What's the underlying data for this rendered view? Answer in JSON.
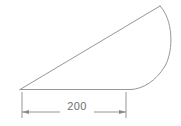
{
  "drawing": {
    "title": "Circular segment with base dimension",
    "background_color": "#ffffff",
    "line_color": "#8a8a8a",
    "text_color": "#6e6e6e",
    "line_width": 0.9,
    "shape": {
      "name": "circular-segment",
      "vertices": {
        "left_base": [
          20,
          89.5
        ],
        "apex": [
          160,
          6
        ],
        "arc_base_end": [
          131,
          89.5
        ]
      },
      "chord_path": "M 20 89.5 L 160 6",
      "arc_path": "M 160 6 C 173 19 174 50 165 66 C 156 81 143 89 131 89.5",
      "base_path": "M 131 89.5 L 20 89.5"
    },
    "dimension": {
      "label": "200",
      "label_position": [
        77,
        110
      ],
      "line_y": 112,
      "line_start_x": 22,
      "line_end_x": 126,
      "extension_left": {
        "x": 22,
        "y_top": 92,
        "y_bottom": 118
      },
      "extension_right": {
        "x": 126,
        "y_top": 92,
        "y_bottom": 118
      },
      "arrow_direction": "inward",
      "arrow_length": 7,
      "arrow_half_width": 1.9,
      "gap_left": [
        22,
        60
      ],
      "gap_right": [
        94,
        126
      ]
    }
  }
}
